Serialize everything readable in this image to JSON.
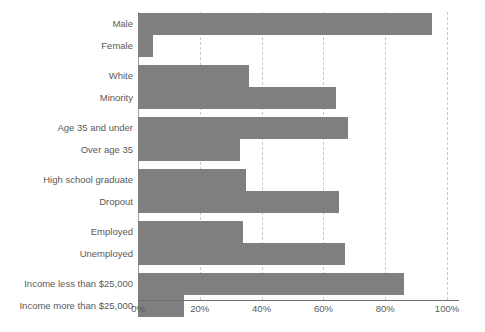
{
  "chart_data": {
    "type": "bar",
    "orientation": "horizontal",
    "title": "",
    "subtitle": "",
    "xlabel": "",
    "ylabel": "",
    "xlim": [
      0,
      100
    ],
    "grid": true,
    "legend": null,
    "tick_labels": [
      "0%",
      "20%",
      "40%",
      "60%",
      "80%",
      "100%"
    ],
    "tick_values": [
      0,
      20,
      40,
      60,
      80,
      100
    ],
    "bar_color": "#7f7f7f",
    "label_color": "#595959",
    "gridline_color": "#c9c9c9",
    "axis_color": "#6e6e6e",
    "groups": [
      {
        "name": "gender",
        "categories": [
          "Male",
          "Female"
        ],
        "values": [
          95,
          5
        ]
      },
      {
        "name": "race",
        "categories": [
          "White",
          "Minority"
        ],
        "values": [
          36,
          64
        ]
      },
      {
        "name": "age",
        "categories": [
          "Age 35 and under",
          "Over age 35"
        ],
        "values": [
          68,
          33
        ]
      },
      {
        "name": "education",
        "categories": [
          "High school graduate",
          "Dropout"
        ],
        "values": [
          35,
          65
        ]
      },
      {
        "name": "employment",
        "categories": [
          "Employed",
          "Unemployed"
        ],
        "values": [
          34,
          67
        ]
      },
      {
        "name": "income",
        "categories": [
          "Income less than $25,000",
          "Income more than $25,000"
        ],
        "values": [
          86,
          15
        ]
      }
    ],
    "categories": [
      "Male",
      "Female",
      "White",
      "Minority",
      "Age 35 and under",
      "Over age 35",
      "High school graduate",
      "Dropout",
      "Employed",
      "Unemployed",
      "Income less than $25,000",
      "Income more than $25,000"
    ],
    "values": [
      95,
      5,
      36,
      64,
      68,
      33,
      35,
      65,
      34,
      67,
      86,
      15
    ]
  }
}
